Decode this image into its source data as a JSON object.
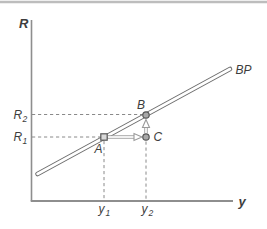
{
  "figure": {
    "y_axis_title": "R",
    "x_axis_title": "y",
    "curve_label": "BP",
    "point_labels": {
      "a": "A",
      "b": "B",
      "c": "C"
    },
    "ticks": {
      "r2_base": "R",
      "r2_sub": "2",
      "r1_base": "R",
      "r1_sub": "1",
      "y1_base": "y",
      "y1_sub": "1",
      "y2_base": "y",
      "y2_sub": "2"
    },
    "colors": {
      "top_rule": "#bdbdbd",
      "axis": "#8e8e8e",
      "dashed": "#8a8a8a",
      "curve_outline": "#6e6e6e",
      "curve_fill": "#ffffff",
      "arrow_outline": "#9a9a9a",
      "arrow_fill": "#ffffff",
      "marker_fill": "#a8a8a8",
      "marker_stroke": "#565656",
      "point_a_fill": "#d9d9d9",
      "label": "#3d3d3d"
    }
  }
}
